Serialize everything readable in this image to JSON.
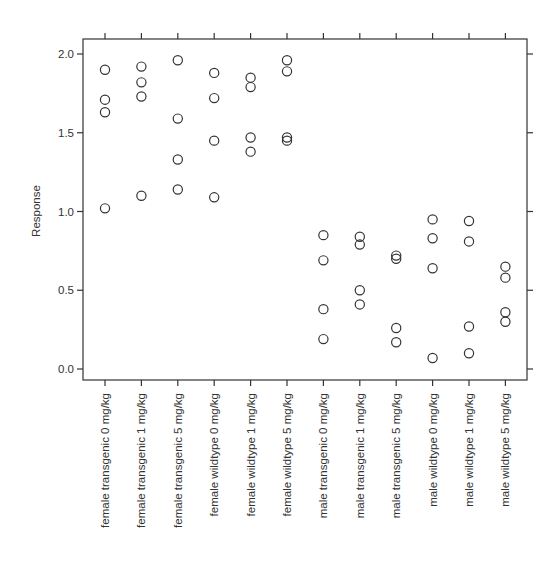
{
  "chart_data": {
    "type": "scatter",
    "title": "",
    "xlabel": "",
    "ylabel": "Response",
    "ylim": [
      -0.05,
      2.08
    ],
    "yticks": [
      0.0,
      0.5,
      1.0,
      1.5,
      2.0
    ],
    "ytick_labels": [
      "0.0",
      "0.5",
      "1.0",
      "1.5",
      "2.0"
    ],
    "grid": false,
    "legend": null,
    "marker": "open-circle",
    "categories": [
      "female transgenic 0 mg/kg",
      "female transgenic 1 mg/kg",
      "female transgenic 5 mg/kg",
      "female wildtype 0 mg/kg",
      "female wildtype 1 mg/kg",
      "female wildtype 5 mg/kg",
      "male transgenic 0 mg/kg",
      "male transgenic 1 mg/kg",
      "male transgenic 5 mg/kg",
      "male wildtype 0 mg/kg",
      "male wildtype 1 mg/kg",
      "male wildtype 5 mg/kg"
    ],
    "values": [
      [
        1.9,
        1.71,
        1.63,
        1.02
      ],
      [
        1.92,
        1.82,
        1.73,
        1.1
      ],
      [
        1.96,
        1.59,
        1.33,
        1.14
      ],
      [
        1.88,
        1.72,
        1.45,
        1.09
      ],
      [
        1.85,
        1.79,
        1.47,
        1.38
      ],
      [
        1.96,
        1.89,
        1.47,
        1.45
      ],
      [
        0.85,
        0.69,
        0.38,
        0.19
      ],
      [
        0.84,
        0.79,
        0.5,
        0.41
      ],
      [
        0.72,
        0.7,
        0.26,
        0.17
      ],
      [
        0.95,
        0.83,
        0.64,
        0.07
      ],
      [
        0.94,
        0.81,
        0.27,
        0.1
      ],
      [
        0.65,
        0.58,
        0.36,
        0.3
      ]
    ]
  }
}
